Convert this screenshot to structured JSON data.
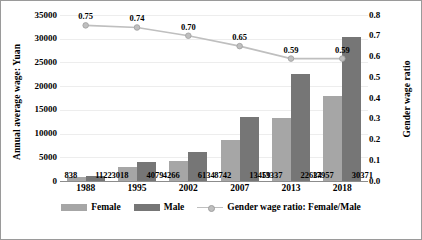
{
  "chart_data": {
    "type": "bar",
    "title": "",
    "subtitle": "",
    "xlabel": "",
    "ylabel": "Annual average wage: Yuan",
    "y2label": "Gender wage ratio",
    "categories": [
      "1988",
      "1995",
      "2002",
      "2007",
      "2013",
      "2018"
    ],
    "series": [
      {
        "name": "Female",
        "type": "bar",
        "axis": "left",
        "color": "#a6a6a6",
        "values": [
          838,
          3018,
          4266,
          8742,
          13337,
          17957
        ],
        "labels": [
          "838",
          "3018",
          "4266",
          "8742",
          "13337",
          "17957"
        ]
      },
      {
        "name": "Male",
        "type": "bar",
        "axis": "left",
        "color": "#767676",
        "values": [
          1122,
          4079,
          6134,
          13459,
          22634,
          30371
        ],
        "labels": [
          "1122",
          "4079",
          "6134",
          "13459",
          "22634",
          "30371"
        ]
      },
      {
        "name": "Gender wage ratio: Female/Male",
        "type": "line",
        "axis": "right",
        "color": "#bfbfbf",
        "values": [
          0.75,
          0.74,
          0.7,
          0.65,
          0.59,
          0.59
        ],
        "labels": [
          "0.75",
          "0.74",
          "0.70",
          "0.65",
          "0.59",
          "0.59"
        ]
      }
    ],
    "ylim": [
      0,
      35000
    ],
    "ytick_step": 5000,
    "yticks": [
      "35000",
      "30000",
      "25000",
      "20000",
      "15000",
      "10000",
      "5000",
      "0"
    ],
    "y2lim": [
      0,
      0.8
    ],
    "y2tick_step": 0.1,
    "y2ticks": [
      "0.8",
      "0.7",
      "0.6",
      "0.5",
      "0.4",
      "0.3",
      "0.2",
      "0.1",
      "0.0"
    ],
    "grid": true,
    "legend_position": "bottom",
    "legend": [
      "Female",
      "Male",
      "Gender wage ratio: Female/Male"
    ]
  },
  "legend": {
    "female_label": "Female",
    "male_label": "Male",
    "ratio_label": "Gender wage ratio: Female/Male"
  },
  "caption": ""
}
